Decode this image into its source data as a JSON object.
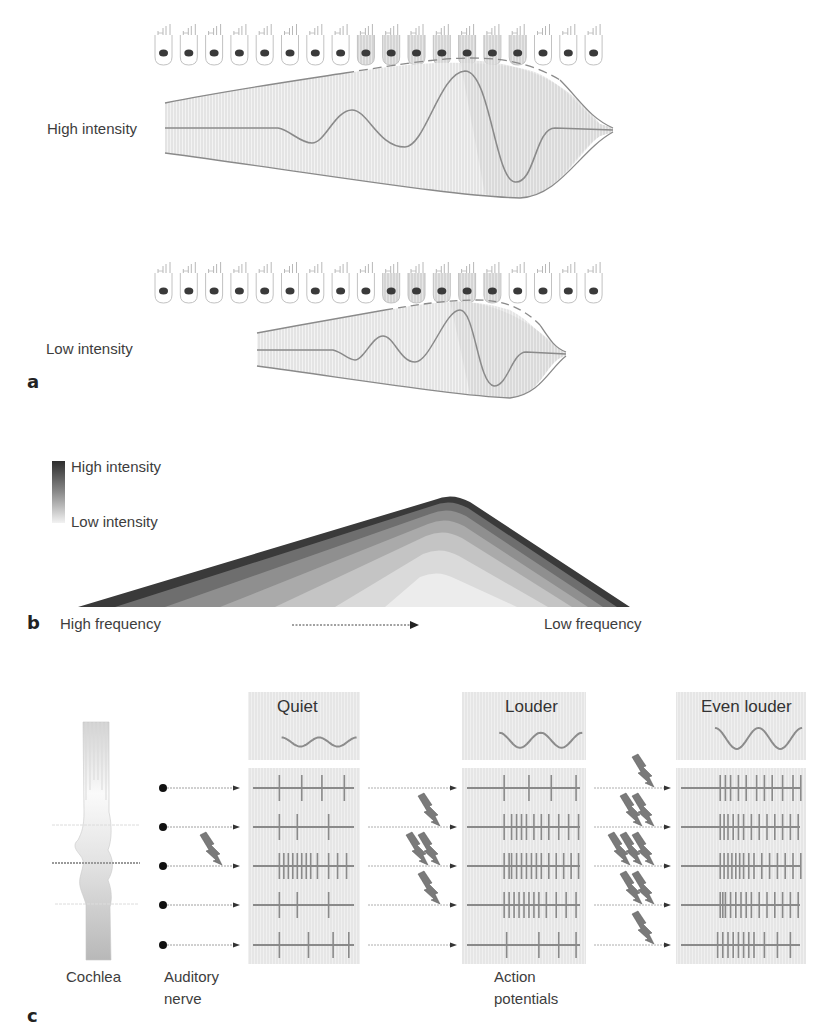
{
  "panel_a": {
    "letter": "a",
    "high_label": "High intensity",
    "low_label": "Low intensity",
    "hair_cell_count": 18,
    "high_shaded_cells": [
      8,
      9,
      10,
      11,
      12,
      13,
      14
    ],
    "low_shaded_cells": [
      9,
      10,
      11,
      12,
      13
    ]
  },
  "panel_b": {
    "letter": "b",
    "legend_high": "High intensity",
    "legend_low": "Low intensity",
    "axis_left": "High frequency",
    "axis_right": "Low frequency",
    "layer_colors": [
      "#3a3a3a",
      "#6e6e6e",
      "#8f8f8f",
      "#aaaaaa",
      "#c4c4c4",
      "#dadada",
      "#ececec"
    ]
  },
  "panel_c": {
    "letter": "c",
    "cochlea_label": "Cochlea",
    "nerve_label_line1": "Auditory",
    "nerve_label_line2": "nerve",
    "ap_label_line1": "Action",
    "ap_label_line2": "potentials",
    "conditions": [
      {
        "title": "Quiet",
        "amplitude": 9
      },
      {
        "title": "Louder",
        "amplitude": 15
      },
      {
        "title": "Even louder",
        "amplitude": 21
      }
    ],
    "spikes": [
      [
        [
          0.28,
          0.48,
          0.66,
          0.86
        ],
        [
          0.28,
          0.44,
          0.72
        ],
        [
          0.28,
          0.32,
          0.36,
          0.4,
          0.44,
          0.48,
          0.52,
          0.56,
          0.62,
          0.72,
          0.8,
          0.88
        ],
        [
          0.28,
          0.44,
          0.72
        ],
        [
          0.28,
          0.54,
          0.76,
          0.9
        ]
      ],
      [
        [
          0.34,
          0.54,
          0.72,
          0.92
        ],
        [
          0.34,
          0.4,
          0.44,
          0.48,
          0.52,
          0.58,
          0.64,
          0.7,
          0.78,
          0.86,
          0.94
        ],
        [
          0.34,
          0.38,
          0.4,
          0.44,
          0.48,
          0.52,
          0.56,
          0.6,
          0.64,
          0.7,
          0.76,
          0.82,
          0.88,
          0.94
        ],
        [
          0.34,
          0.38,
          0.42,
          0.46,
          0.5,
          0.54,
          0.58,
          0.62,
          0.68,
          0.76,
          0.84,
          0.92
        ],
        [
          0.36,
          0.62,
          0.78,
          0.92
        ]
      ],
      [
        [
          0.34,
          0.38,
          0.42,
          0.48,
          0.54,
          0.62,
          0.68,
          0.74,
          0.82,
          0.9,
          0.96
        ],
        [
          0.34,
          0.37,
          0.4,
          0.44,
          0.48,
          0.52,
          0.58,
          0.64,
          0.7,
          0.76,
          0.82,
          0.88,
          0.94
        ],
        [
          0.34,
          0.37,
          0.4,
          0.43,
          0.46,
          0.49,
          0.52,
          0.56,
          0.6,
          0.66,
          0.72,
          0.78,
          0.84,
          0.9,
          0.96
        ],
        [
          0.34,
          0.36,
          0.38,
          0.42,
          0.46,
          0.5,
          0.54,
          0.58,
          0.64,
          0.7,
          0.76,
          0.82,
          0.88,
          0.94
        ],
        [
          0.32,
          0.36,
          0.4,
          0.44,
          0.48,
          0.52,
          0.56,
          0.6,
          0.68,
          0.78,
          0.88
        ]
      ]
    ],
    "bolts": [
      [
        0,
        0,
        1,
        0,
        0
      ],
      [
        0,
        1,
        2,
        1,
        0
      ],
      [
        1,
        2,
        3,
        2,
        1
      ]
    ]
  }
}
